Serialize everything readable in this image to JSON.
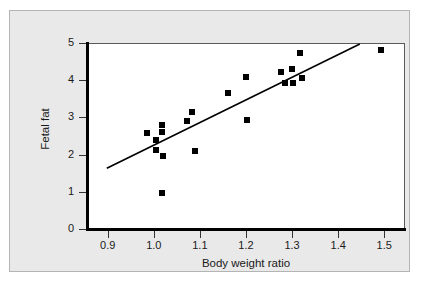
{
  "figure": {
    "background_color": "#e9e9e9",
    "plot_background_color": "#ffffff",
    "axis_color": "#000000",
    "marker_color": "#000000",
    "line_color": "#000000"
  },
  "chart_data": {
    "type": "scatter",
    "title": "",
    "xlabel": "Body weight ratio",
    "ylabel": "Fetal fat",
    "xlim": [
      0.855,
      1.545
    ],
    "ylim": [
      0,
      5
    ],
    "xticks": [
      0.9,
      1.0,
      1.1,
      1.2,
      1.3,
      1.4,
      1.5
    ],
    "xtick_labels": [
      "0.9",
      "1.0",
      "1.1",
      "1.2",
      "1.3",
      "1.4",
      "1.5"
    ],
    "yticks": [
      0,
      1,
      2,
      3,
      4,
      5
    ],
    "ytick_labels": [
      "0",
      "1",
      "2",
      "3",
      "4",
      "5"
    ],
    "grid": false,
    "legend": null,
    "points": [
      {
        "x": 0.985,
        "y": 2.6
      },
      {
        "x": 1.005,
        "y": 2.42
      },
      {
        "x": 1.005,
        "y": 2.15
      },
      {
        "x": 1.018,
        "y": 2.81
      },
      {
        "x": 1.018,
        "y": 2.63
      },
      {
        "x": 1.02,
        "y": 1.99
      },
      {
        "x": 1.018,
        "y": 1.0
      },
      {
        "x": 1.073,
        "y": 2.94
      },
      {
        "x": 1.082,
        "y": 3.17
      },
      {
        "x": 1.09,
        "y": 2.12
      },
      {
        "x": 1.16,
        "y": 3.67
      },
      {
        "x": 1.2,
        "y": 4.1
      },
      {
        "x": 1.202,
        "y": 2.96
      },
      {
        "x": 1.277,
        "y": 4.24
      },
      {
        "x": 1.285,
        "y": 3.95
      },
      {
        "x": 1.3,
        "y": 4.33
      },
      {
        "x": 1.303,
        "y": 3.95
      },
      {
        "x": 1.318,
        "y": 4.77
      },
      {
        "x": 1.322,
        "y": 4.08
      },
      {
        "x": 1.492,
        "y": 4.84
      }
    ],
    "trend_line": {
      "x_start": 0.898,
      "y_start": 1.66,
      "x_end": 1.447,
      "y_end": 5.0
    }
  }
}
